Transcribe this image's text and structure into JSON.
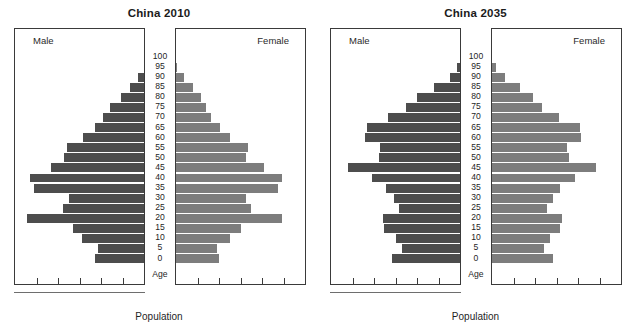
{
  "figure": {
    "xlabel": "Population",
    "age_axis_caption": "Age",
    "male_label": "Male",
    "female_label": "Female",
    "male_color": "#4d4d4d",
    "female_color": "#7d7d7d",
    "border_color": "#3a3a3a"
  },
  "charts": [
    {
      "id": "2010",
      "title": "China 2010"
    },
    {
      "id": "2035",
      "title": "China 2035"
    }
  ],
  "age_groups": [
    "100",
    "95",
    "90",
    "85",
    "80",
    "75",
    "70",
    "65",
    "60",
    "55",
    "50",
    "45",
    "40",
    "35",
    "30",
    "25",
    "20",
    "15",
    "10",
    "5",
    "0"
  ],
  "chart_data": [
    {
      "type": "bar",
      "subtype": "population-pyramid",
      "title": "China 2010",
      "xlabel": "Population",
      "ylabel": "Age",
      "grid": false,
      "legend": [
        "Male",
        "Female"
      ],
      "legend_position": "inside-panel-top",
      "categories": [
        "100",
        "95",
        "90",
        "85",
        "80",
        "75",
        "70",
        "65",
        "60",
        "55",
        "50",
        "45",
        "40",
        "35",
        "30",
        "25",
        "20",
        "15",
        "10",
        "5",
        "0"
      ],
      "xlim": [
        0,
        100
      ],
      "series": [
        {
          "name": "Male",
          "side": "left",
          "color": "#4d4d4d",
          "values": [
            0,
            0,
            5,
            11,
            18,
            26,
            32,
            38,
            47,
            60,
            62,
            72,
            88,
            85,
            58,
            63,
            91,
            55,
            48,
            36,
            38
          ]
        },
        {
          "name": "Female",
          "side": "right",
          "color": "#7d7d7d",
          "values": [
            0,
            1,
            6,
            13,
            19,
            23,
            27,
            34,
            42,
            56,
            54,
            68,
            82,
            79,
            54,
            58,
            82,
            50,
            42,
            32,
            33
          ]
        }
      ]
    },
    {
      "type": "bar",
      "subtype": "population-pyramid",
      "title": "China 2035",
      "xlabel": "Population",
      "ylabel": "Age",
      "grid": false,
      "legend": [
        "Male",
        "Female"
      ],
      "legend_position": "inside-panel-top",
      "categories": [
        "100",
        "95",
        "90",
        "85",
        "80",
        "75",
        "70",
        "65",
        "60",
        "55",
        "50",
        "45",
        "40",
        "35",
        "30",
        "25",
        "20",
        "15",
        "10",
        "5",
        "0"
      ],
      "xlim": [
        0,
        100
      ],
      "series": [
        {
          "name": "Male",
          "side": "left",
          "color": "#4d4d4d",
          "values": [
            0,
            2,
            8,
            20,
            33,
            42,
            56,
            72,
            74,
            62,
            63,
            87,
            68,
            57,
            51,
            47,
            60,
            59,
            50,
            45,
            53
          ]
        },
        {
          "name": "Female",
          "side": "right",
          "color": "#7d7d7d",
          "values": [
            0,
            3,
            10,
            22,
            32,
            39,
            52,
            68,
            69,
            58,
            60,
            81,
            64,
            53,
            47,
            43,
            54,
            53,
            45,
            40,
            47
          ]
        }
      ]
    }
  ],
  "x_tick_count": 5
}
